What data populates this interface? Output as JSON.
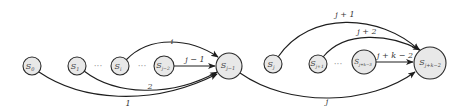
{
  "diagram": {
    "nodes": [
      {
        "id": "s0",
        "base": "S",
        "sub": "0"
      },
      {
        "id": "s1",
        "base": "S",
        "sub": "1"
      },
      {
        "id": "si",
        "base": "S",
        "sub": "i"
      },
      {
        "id": "sj2",
        "base": "S",
        "sub": "j−2"
      },
      {
        "id": "sj1",
        "base": "S",
        "sub": "j−1"
      },
      {
        "id": "sj",
        "base": "S",
        "sub": "j"
      },
      {
        "id": "sjp1",
        "base": "S",
        "sub": "j+1"
      },
      {
        "id": "sjk3",
        "base": "S",
        "sub": "j+k−3"
      },
      {
        "id": "sjk2",
        "base": "S",
        "sub": "j+k−2"
      }
    ],
    "ellipses": [
      {
        "between": [
          "s1",
          "si"
        ],
        "text": "···"
      },
      {
        "between": [
          "si",
          "sj2"
        ],
        "text": "···"
      },
      {
        "between": [
          "sjp1",
          "sjk3"
        ],
        "text": "···"
      }
    ],
    "edges": [
      {
        "from": "s0",
        "to": "sj1",
        "label": "1"
      },
      {
        "from": "s1",
        "to": "sj1",
        "label": "2"
      },
      {
        "from": "si",
        "to": "sj1",
        "label": "i"
      },
      {
        "from": "sj2",
        "to": "sj1",
        "label": "j − 1"
      },
      {
        "from": "sj1",
        "to": "sjk2",
        "label": "j"
      },
      {
        "from": "sj",
        "to": "sjk2",
        "label": "j + 1"
      },
      {
        "from": "sjp1",
        "to": "sjk2",
        "label": "j + 2"
      },
      {
        "from": "sjk3",
        "to": "sjk2",
        "label": "j + k − 2"
      }
    ]
  }
}
